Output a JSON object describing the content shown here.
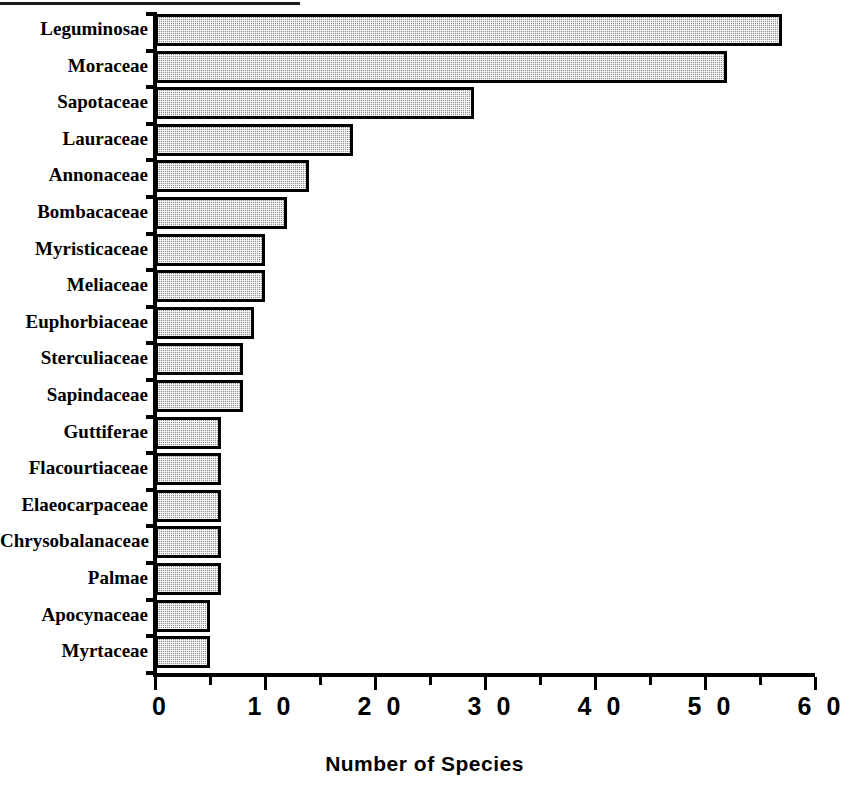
{
  "chart_data": {
    "type": "bar",
    "orientation": "horizontal",
    "title": "",
    "xlabel": "Number of Species",
    "ylabel": "",
    "xlim": [
      0,
      60
    ],
    "xticks": [
      0,
      10,
      20,
      30,
      40,
      50,
      60
    ],
    "xticklabels": [
      "0",
      "1 0",
      "2 0",
      "3 0",
      "4 0",
      "5 0",
      "6 0"
    ],
    "minor_xticks": [
      5,
      15,
      25,
      35,
      45,
      55
    ],
    "grid": false,
    "legend": false,
    "bar_fill": "#8e8e8e",
    "bar_edge": "#000000",
    "categories": [
      "Leguminosae",
      "Moraceae",
      "Sapotaceae",
      "Lauraceae",
      "Annonaceae",
      "Bombacaceae",
      "Myristicaceae",
      "Meliaceae",
      "Euphorbiaceae",
      "Sterculiaceae",
      "Sapindaceae",
      "Guttiferae",
      "Flacourtiaceae",
      "Elaeocarpaceae",
      "Chrysobalanaceae",
      "Palmae",
      "Apocynaceae",
      "Myrtaceae"
    ],
    "values": [
      57,
      52,
      29,
      18,
      14,
      12,
      10,
      10,
      9,
      8,
      8,
      6,
      6,
      6,
      6,
      6,
      5,
      5
    ]
  }
}
